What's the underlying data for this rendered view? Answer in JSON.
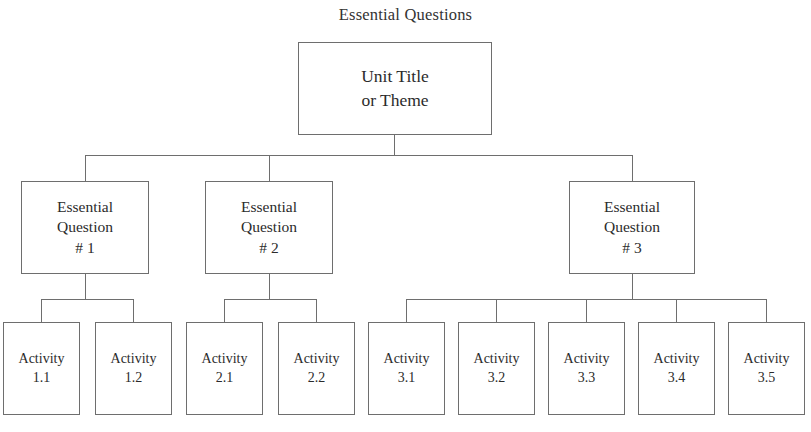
{
  "diagram": {
    "type": "tree",
    "title": "Essential Questions",
    "background_color": "#ffffff",
    "line_color": "#6e6e6e",
    "text_color": "#2b2b2b",
    "root": {
      "id": "unit",
      "label": "Unit Title\nor Theme"
    },
    "levels": {
      "level2_label": "Essential Question",
      "level3_label": "Activity"
    },
    "questions": [
      {
        "id": "eq1",
        "label": "Essential\nQuestion\n# 1",
        "number": "# 1",
        "activities": [
          {
            "id": "act-1-1",
            "label": "Activity\n1.1",
            "number": "1.1"
          },
          {
            "id": "act-1-2",
            "label": "Activity\n1.2",
            "number": "1.2"
          }
        ]
      },
      {
        "id": "eq2",
        "label": "Essential\nQuestion\n# 2",
        "number": "# 2",
        "activities": [
          {
            "id": "act-2-1",
            "label": "Activity\n2.1",
            "number": "2.1"
          },
          {
            "id": "act-2-2",
            "label": "Activity\n2.2",
            "number": "2.2"
          }
        ]
      },
      {
        "id": "eq3",
        "label": "Essential\nQuestion\n# 3",
        "number": "# 3",
        "activities": [
          {
            "id": "act-3-1",
            "label": "Activity\n3.1",
            "number": "3.1"
          },
          {
            "id": "act-3-2",
            "label": "Activity\n3.2",
            "number": "3.2"
          },
          {
            "id": "act-3-3",
            "label": "Activity\n3.3",
            "number": "3.3"
          },
          {
            "id": "act-3-4",
            "label": "Activity\n3.4",
            "number": "3.4"
          },
          {
            "id": "act-3-5",
            "label": "Activity\n3.5",
            "number": "3.5"
          }
        ]
      }
    ],
    "footer_sliver": ""
  }
}
